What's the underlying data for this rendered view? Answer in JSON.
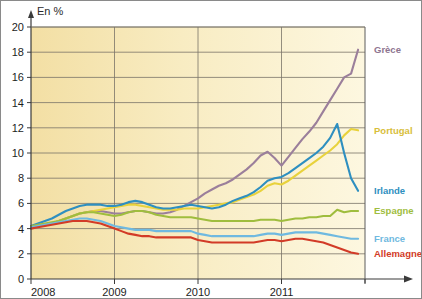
{
  "chart_data": {
    "type": "line",
    "title": "",
    "subtitle": "",
    "ylabel": "En  %",
    "xlabel": "",
    "ylim": [
      0,
      20
    ],
    "xlim": [
      2008,
      2012
    ],
    "ytick_values": [
      0,
      2,
      4,
      6,
      8,
      10,
      12,
      14,
      16,
      18,
      20
    ],
    "xtick_labels": [
      "2008",
      "2009",
      "2010",
      "2011"
    ],
    "xtick_values": [
      2008,
      2009,
      2010,
      2011
    ],
    "grid": "both",
    "legend_position": "right-inline",
    "plot_background": "#f7ebc0",
    "series": [
      {
        "name": "Grèce",
        "color": "#9b7f9b",
        "label_color": "#8e7590",
        "label_value": 18.2,
        "x": [
          2008.0,
          2008.083,
          2008.167,
          2008.25,
          2008.333,
          2008.417,
          2008.5,
          2008.583,
          2008.667,
          2008.75,
          2008.833,
          2008.917,
          2009.0,
          2009.083,
          2009.167,
          2009.25,
          2009.333,
          2009.417,
          2009.5,
          2009.583,
          2009.667,
          2009.75,
          2009.833,
          2009.917,
          2010.0,
          2010.083,
          2010.167,
          2010.25,
          2010.333,
          2010.417,
          2010.5,
          2010.583,
          2010.667,
          2010.75,
          2010.833,
          2010.917,
          2011.0,
          2011.083,
          2011.167,
          2011.25,
          2011.333,
          2011.417,
          2011.5,
          2011.583,
          2011.667,
          2011.75,
          2011.833,
          2011.917
        ],
        "values": [
          4.1,
          4.2,
          4.3,
          4.4,
          4.6,
          4.8,
          5.0,
          5.2,
          5.3,
          5.4,
          5.4,
          5.3,
          5.2,
          5.2,
          5.3,
          5.4,
          5.4,
          5.3,
          5.2,
          5.2,
          5.3,
          5.5,
          5.8,
          6.1,
          6.4,
          6.8,
          7.1,
          7.4,
          7.6,
          7.9,
          8.3,
          8.7,
          9.2,
          9.8,
          10.1,
          9.6,
          9.0,
          9.7,
          10.4,
          11.1,
          11.7,
          12.4,
          13.3,
          14.2,
          15.1,
          16.0,
          16.3,
          18.2
        ]
      },
      {
        "name": "Portugal",
        "color": "#e8d23c",
        "label_color": "#d8be3a",
        "label_value": 11.8,
        "x": [
          2008.0,
          2008.083,
          2008.167,
          2008.25,
          2008.333,
          2008.417,
          2008.5,
          2008.583,
          2008.667,
          2008.75,
          2008.833,
          2008.917,
          2009.0,
          2009.083,
          2009.167,
          2009.25,
          2009.333,
          2009.417,
          2009.5,
          2009.583,
          2009.667,
          2009.75,
          2009.833,
          2009.917,
          2010.0,
          2010.083,
          2010.167,
          2010.25,
          2010.333,
          2010.417,
          2010.5,
          2010.583,
          2010.667,
          2010.75,
          2010.833,
          2010.917,
          2011.0,
          2011.083,
          2011.167,
          2011.25,
          2011.333,
          2011.417,
          2011.5,
          2011.583,
          2011.667,
          2011.75,
          2011.833,
          2011.917
        ],
        "values": [
          4.1,
          4.2,
          4.3,
          4.4,
          4.6,
          4.8,
          5.0,
          5.2,
          5.3,
          5.4,
          5.5,
          5.6,
          5.7,
          5.8,
          5.9,
          5.9,
          5.8,
          5.7,
          5.6,
          5.5,
          5.5,
          5.5,
          5.6,
          5.6,
          5.6,
          5.7,
          5.8,
          5.9,
          6.0,
          6.1,
          6.3,
          6.5,
          6.7,
          7.0,
          7.4,
          7.6,
          7.5,
          7.8,
          8.2,
          8.6,
          9.0,
          9.4,
          9.8,
          10.2,
          10.7,
          11.4,
          11.9,
          11.8
        ]
      },
      {
        "name": "Irlande",
        "color": "#2e8fc0",
        "label_color": "#2e8fc0",
        "label_value": 7.0,
        "x": [
          2008.0,
          2008.083,
          2008.167,
          2008.25,
          2008.333,
          2008.417,
          2008.5,
          2008.583,
          2008.667,
          2008.75,
          2008.833,
          2008.917,
          2009.0,
          2009.083,
          2009.167,
          2009.25,
          2009.333,
          2009.417,
          2009.5,
          2009.583,
          2009.667,
          2009.75,
          2009.833,
          2009.917,
          2010.0,
          2010.083,
          2010.167,
          2010.25,
          2010.333,
          2010.417,
          2010.5,
          2010.583,
          2010.667,
          2010.75,
          2010.833,
          2010.917,
          2011.0,
          2011.083,
          2011.167,
          2011.25,
          2011.333,
          2011.417,
          2011.5,
          2011.583,
          2011.667,
          2011.75,
          2011.833,
          2011.917
        ],
        "values": [
          4.2,
          4.4,
          4.6,
          4.8,
          5.1,
          5.4,
          5.6,
          5.8,
          5.9,
          5.9,
          5.9,
          5.8,
          5.8,
          5.9,
          6.1,
          6.2,
          6.1,
          5.9,
          5.7,
          5.6,
          5.6,
          5.7,
          5.8,
          5.9,
          5.8,
          5.7,
          5.6,
          5.7,
          5.9,
          6.2,
          6.4,
          6.6,
          6.9,
          7.3,
          7.8,
          8.0,
          8.1,
          8.4,
          8.8,
          9.2,
          9.6,
          10.0,
          10.5,
          11.2,
          12.3,
          10.0,
          8.0,
          7.0
        ]
      },
      {
        "name": "Espagne",
        "color": "#a8c council",
        "label_color": "#9fbd3e",
        "label_value": 5.4,
        "x": [
          2008.0,
          2008.083,
          2008.167,
          2008.25,
          2008.333,
          2008.417,
          2008.5,
          2008.583,
          2008.667,
          2008.75,
          2008.833,
          2008.917,
          2009.0,
          2009.083,
          2009.167,
          2009.25,
          2009.333,
          2009.417,
          2009.5,
          2009.583,
          2009.667,
          2009.75,
          2009.833,
          2009.917,
          2010.0,
          2010.083,
          2010.167,
          2010.25,
          2010.333,
          2010.417,
          2010.5,
          2010.583,
          2010.667,
          2010.75,
          2010.833,
          2010.917,
          2011.0,
          2011.083,
          2011.167,
          2011.25,
          2011.333,
          2011.417,
          2011.5,
          2011.583,
          2011.667,
          2011.75,
          2011.833,
          2011.917
        ],
        "values": [
          4.2,
          4.3,
          4.4,
          4.5,
          4.6,
          4.8,
          5.0,
          5.2,
          5.3,
          5.3,
          5.2,
          5.1,
          5.0,
          5.1,
          5.3,
          5.4,
          5.4,
          5.3,
          5.1,
          5.0,
          4.9,
          4.9,
          4.9,
          4.9,
          4.8,
          4.7,
          4.6,
          4.6,
          4.6,
          4.6,
          4.6,
          4.6,
          4.6,
          4.7,
          4.7,
          4.7,
          4.6,
          4.7,
          4.8,
          4.8,
          4.9,
          4.9,
          5.0,
          5.0,
          5.5,
          5.3,
          5.4,
          5.4
        ]
      },
      {
        "name": "France",
        "color": "#6fb9e0",
        "label_color": "#6fb9e0",
        "label_value": 3.2,
        "x": [
          2008.0,
          2008.083,
          2008.167,
          2008.25,
          2008.333,
          2008.417,
          2008.5,
          2008.583,
          2008.667,
          2008.75,
          2008.833,
          2008.917,
          2009.0,
          2009.083,
          2009.167,
          2009.25,
          2009.333,
          2009.417,
          2009.5,
          2009.583,
          2009.667,
          2009.75,
          2009.833,
          2009.917,
          2010.0,
          2010.083,
          2010.167,
          2010.25,
          2010.333,
          2010.417,
          2010.5,
          2010.583,
          2010.667,
          2010.75,
          2010.833,
          2010.917,
          2011.0,
          2011.083,
          2011.167,
          2011.25,
          2011.333,
          2011.417,
          2011.5,
          2011.583,
          2011.667,
          2011.75,
          2011.833,
          2011.917
        ],
        "values": [
          4.1,
          4.2,
          4.3,
          4.4,
          4.5,
          4.6,
          4.7,
          4.8,
          4.8,
          4.7,
          4.6,
          4.4,
          4.2,
          4.1,
          4.0,
          3.9,
          3.9,
          3.9,
          3.8,
          3.8,
          3.8,
          3.8,
          3.8,
          3.8,
          3.6,
          3.5,
          3.4,
          3.4,
          3.4,
          3.4,
          3.4,
          3.4,
          3.4,
          3.5,
          3.6,
          3.6,
          3.5,
          3.6,
          3.7,
          3.7,
          3.7,
          3.7,
          3.6,
          3.5,
          3.4,
          3.3,
          3.2,
          3.2
        ]
      },
      {
        "name": "Allemagne",
        "color": "#d23b27",
        "label_color": "#d23b27",
        "label_value": 2.0,
        "x": [
          2008.0,
          2008.083,
          2008.167,
          2008.25,
          2008.333,
          2008.417,
          2008.5,
          2008.583,
          2008.667,
          2008.75,
          2008.833,
          2008.917,
          2009.0,
          2009.083,
          2009.167,
          2009.25,
          2009.333,
          2009.417,
          2009.5,
          2009.583,
          2009.667,
          2009.75,
          2009.833,
          2009.917,
          2010.0,
          2010.083,
          2010.167,
          2010.25,
          2010.333,
          2010.417,
          2010.5,
          2010.583,
          2010.667,
          2010.75,
          2010.833,
          2010.917,
          2011.0,
          2011.083,
          2011.167,
          2011.25,
          2011.333,
          2011.417,
          2011.5,
          2011.583,
          2011.667,
          2011.75,
          2011.833,
          2011.917
        ],
        "values": [
          4.0,
          4.1,
          4.2,
          4.3,
          4.4,
          4.5,
          4.6,
          4.6,
          4.6,
          4.5,
          4.4,
          4.2,
          4.0,
          3.8,
          3.6,
          3.5,
          3.4,
          3.4,
          3.3,
          3.3,
          3.3,
          3.3,
          3.3,
          3.3,
          3.1,
          3.0,
          2.9,
          2.9,
          2.9,
          2.9,
          2.9,
          2.9,
          2.9,
          3.0,
          3.1,
          3.1,
          3.0,
          3.1,
          3.2,
          3.2,
          3.1,
          3.0,
          2.9,
          2.7,
          2.5,
          2.3,
          2.1,
          2.0
        ]
      }
    ]
  }
}
